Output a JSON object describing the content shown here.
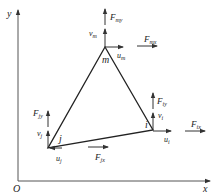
{
  "caption_fragment": "(a) ...",
  "axes": {
    "x_label": "x",
    "y_label": "y",
    "origin_label": "O"
  },
  "nodes": [
    {
      "id": "m",
      "label": "m",
      "u": "u",
      "u_sub": "m",
      "v": "v",
      "v_sub": "m",
      "Fx": "F",
      "Fx_sub": "mx",
      "Fy": "F",
      "Fy_sub": "my"
    },
    {
      "id": "i",
      "label": "i",
      "u": "u",
      "u_sub": "i",
      "v": "v",
      "v_sub": "i",
      "Fx": "F",
      "Fx_sub": "ix",
      "Fy": "F",
      "Fy_sub": "iy"
    },
    {
      "id": "j",
      "label": "j",
      "u": "u",
      "u_sub": "j",
      "v": "v",
      "v_sub": "j",
      "Fx": "F",
      "Fx_sub": "jx",
      "Fy": "F",
      "Fy_sub": "jy"
    }
  ],
  "colors": {
    "line": "#222222",
    "axis": "#555555",
    "background": "#ffffff"
  }
}
